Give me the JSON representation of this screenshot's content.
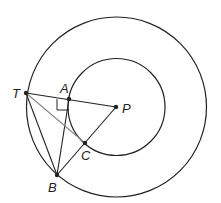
{
  "diagram": {
    "colors": {
      "stroke": "#222222",
      "secondary_stroke": "#888888",
      "background": "#ffffff"
    },
    "circles": [
      {
        "name": "outer-circle",
        "cx": 116.5,
        "cy": 107,
        "r": 90
      },
      {
        "name": "inner-circle",
        "cx": 116.5,
        "cy": 107,
        "r": 48.5
      }
    ],
    "points": [
      {
        "id": "T",
        "label": "T",
        "x": 26,
        "y": 93,
        "lx": 12,
        "ly": 98
      },
      {
        "id": "A",
        "label": "A",
        "x": 69,
        "y": 99,
        "lx": 60,
        "ly": 93
      },
      {
        "id": "P",
        "label": "P",
        "x": 116,
        "y": 107,
        "lx": 122,
        "ly": 113
      },
      {
        "id": "C",
        "label": "C",
        "x": 85,
        "y": 143,
        "lx": 81,
        "ly": 160
      },
      {
        "id": "B",
        "label": "B",
        "x": 57,
        "y": 175,
        "lx": 48,
        "ly": 192
      }
    ],
    "segments": [
      {
        "from": "T",
        "to": "P",
        "style": "primary"
      },
      {
        "from": "A",
        "to": "B",
        "style": "primary"
      },
      {
        "from": "B",
        "to": "P",
        "style": "primary"
      },
      {
        "from": "T",
        "to": "B",
        "style": "primary"
      },
      {
        "from": "T",
        "to": "C",
        "style": "secondary"
      }
    ],
    "right_angle": {
      "at": "A",
      "path": "M57,99 L57,110 L69,110"
    }
  }
}
